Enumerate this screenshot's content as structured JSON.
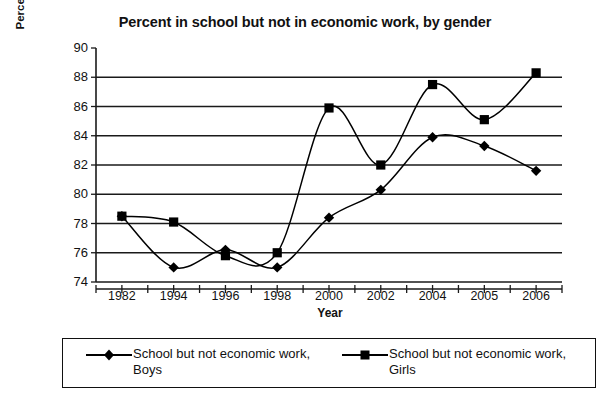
{
  "chart_data": {
    "type": "line",
    "title": "Percent in school but not in economic work, by gender",
    "xlabel": "Year",
    "ylabel": "Percent of Age-Group",
    "categories": [
      "1982",
      "1994",
      "1996",
      "1998",
      "2000",
      "2002",
      "2004",
      "2005",
      "2006"
    ],
    "ylim": [
      74,
      90
    ],
    "yticks": [
      74,
      76,
      78,
      80,
      82,
      84,
      86,
      88,
      90
    ],
    "grid": "horizontal",
    "legend_position": "bottom",
    "smoothing": "spline",
    "series": [
      {
        "name": "School but not economic work, Boys",
        "marker": "diamond",
        "color": "#000000",
        "values": [
          78.5,
          75.0,
          76.2,
          75.0,
          78.4,
          80.3,
          83.9,
          83.3,
          81.6
        ]
      },
      {
        "name": "School but not economic work, Girls",
        "marker": "square",
        "color": "#000000",
        "values": [
          78.5,
          78.1,
          75.8,
          76.0,
          85.9,
          82.0,
          87.5,
          85.1,
          88.3
        ]
      }
    ]
  },
  "legend": {
    "entries": [
      {
        "label": "School but not economic work, Boys",
        "marker": "diamond-marker-icon"
      },
      {
        "label": "School but not economic work, Girls",
        "marker": "square-marker-icon"
      }
    ]
  }
}
